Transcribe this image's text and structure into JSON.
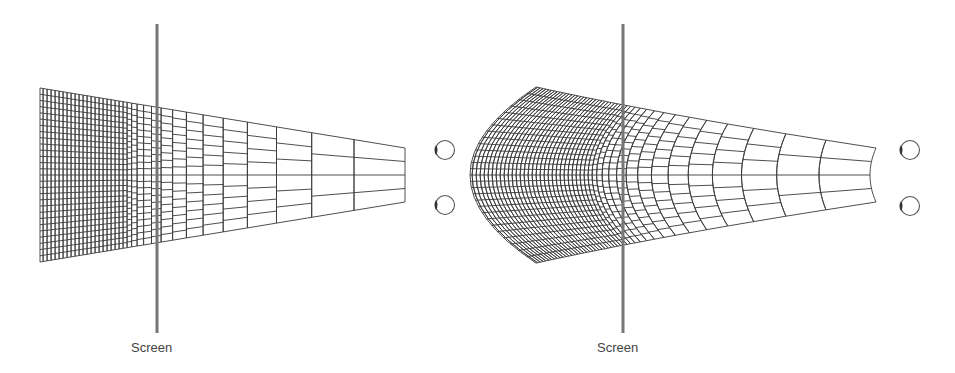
{
  "panels": [
    {
      "id": "flat",
      "screen_label": "Screen",
      "screen_x": 157,
      "label_x": 131,
      "grid": {
        "x_near": 405,
        "x_far": 40,
        "half_h_near": 27,
        "half_h_far": 87,
        "type": "flat"
      },
      "eyes": [
        {
          "cx": 445,
          "cy": 150
        },
        {
          "cx": 445,
          "cy": 205
        }
      ]
    },
    {
      "id": "curved",
      "screen_label": "Screen",
      "screen_x": 623,
      "label_x": 597,
      "grid": {
        "x_near": 870,
        "x_far": 470,
        "half_h_near": 27,
        "half_h_far": 88,
        "type": "curved"
      },
      "eyes": [
        {
          "cx": 910,
          "cy": 150
        },
        {
          "cx": 910,
          "cy": 206
        }
      ]
    }
  ],
  "layout": {
    "center_y": 175,
    "screen_top": 24,
    "screen_bottom": 333,
    "label_y": 340
  },
  "colors": {
    "line": "#3a3a3a",
    "screen": "#777777",
    "eye": "#555555",
    "text": "#444444"
  }
}
